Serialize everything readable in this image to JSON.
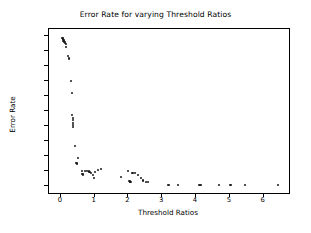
{
  "chart_data": {
    "type": "scatter",
    "title": "Error Rate for varying Threshold Ratios",
    "xlabel": "Threshold Ratios",
    "ylabel": "Error Rate",
    "xlim": [
      -0.35,
      6.75
    ],
    "ylim": [
      -0.05,
      1.05
    ],
    "xticks": [
      0,
      1,
      2,
      3,
      4,
      5,
      6
    ],
    "xtick_labels": [
      "0",
      "1",
      "2",
      "3",
      "4",
      "5",
      "6"
    ],
    "yticks": [
      0.0,
      0.1,
      0.2,
      0.3,
      0.4,
      0.5,
      0.6,
      0.7,
      0.8,
      0.9,
      1.0
    ],
    "ytick_labels": [
      "0.0",
      "0.1",
      "0.2",
      "0.3",
      "0.4",
      "0.5",
      "0.6",
      "0.7",
      "0.8",
      "0.9",
      "1.0"
    ],
    "grid": false,
    "legend": null,
    "marker": "circle",
    "marker_color": "#1a1a1a",
    "series": [
      {
        "name": "Error Rate",
        "x": [
          0.05,
          0.06,
          0.07,
          0.08,
          0.09,
          0.1,
          0.12,
          0.13,
          0.15,
          0.16,
          0.22,
          0.24,
          0.25,
          0.3,
          0.33,
          0.34,
          0.35,
          0.35,
          0.36,
          0.36,
          0.37,
          0.42,
          0.46,
          0.47,
          0.5,
          0.62,
          0.64,
          0.66,
          0.72,
          0.78,
          0.82,
          0.86,
          0.9,
          0.94,
          0.98,
          1.0,
          1.1,
          1.18,
          1.78,
          2.0,
          2.02,
          2.04,
          2.05,
          2.06,
          2.12,
          2.2,
          2.28,
          2.36,
          2.44,
          2.52,
          2.58,
          3.16,
          3.2,
          3.46,
          4.08,
          4.12,
          4.16,
          4.68,
          5.02,
          5.44,
          6.42
        ],
        "y": [
          0.99,
          0.98,
          0.985,
          0.97,
          0.975,
          0.96,
          0.955,
          0.965,
          0.95,
          0.93,
          0.87,
          0.855,
          0.85,
          0.7,
          0.62,
          0.475,
          0.455,
          0.44,
          0.42,
          0.405,
          0.395,
          0.268,
          0.152,
          0.148,
          0.182,
          0.098,
          0.078,
          0.072,
          0.095,
          0.095,
          0.094,
          0.093,
          0.082,
          0.072,
          0.052,
          0.092,
          0.103,
          0.108,
          0.058,
          0.1,
          0.032,
          0.028,
          0.022,
          0.026,
          0.085,
          0.082,
          0.072,
          0.048,
          0.034,
          0.024,
          0.026,
          0.004,
          0.002,
          0.003,
          0.002,
          0.002,
          0.002,
          0.002,
          0.003,
          0.002,
          0.006
        ]
      }
    ]
  }
}
